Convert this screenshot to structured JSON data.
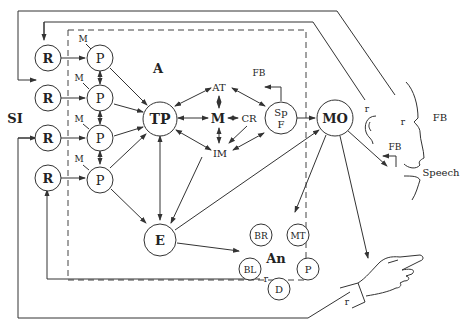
{
  "diagram": {
    "region_label": "A",
    "side_label": "SI",
    "receptors": [
      {
        "label": "R"
      },
      {
        "label": "R"
      },
      {
        "label": "R"
      },
      {
        "label": "R"
      }
    ],
    "processors": [
      {
        "label": "P",
        "tag": "M"
      },
      {
        "label": "P",
        "tag": "M"
      },
      {
        "label": "P",
        "tag": "M"
      },
      {
        "label": "P",
        "tag": "M"
      }
    ],
    "nodes": {
      "tp": "TP",
      "m": "M",
      "at": "AT",
      "cr": "CR",
      "im": "IM",
      "spf_top": "Sp",
      "spf_bottom": "F",
      "mo": "MO",
      "e": "E"
    },
    "feedback": {
      "fb_spf": "FB",
      "fb_face": "FB",
      "fb_mouth": "FB"
    },
    "outputs": {
      "speech": "Speech",
      "r_ear": "r",
      "r_face": "r",
      "r_hand": "r",
      "r_bottom": "r"
    },
    "an_group": {
      "label": "An",
      "items": [
        "BR",
        "MT",
        "BL",
        "P",
        "D"
      ]
    }
  }
}
